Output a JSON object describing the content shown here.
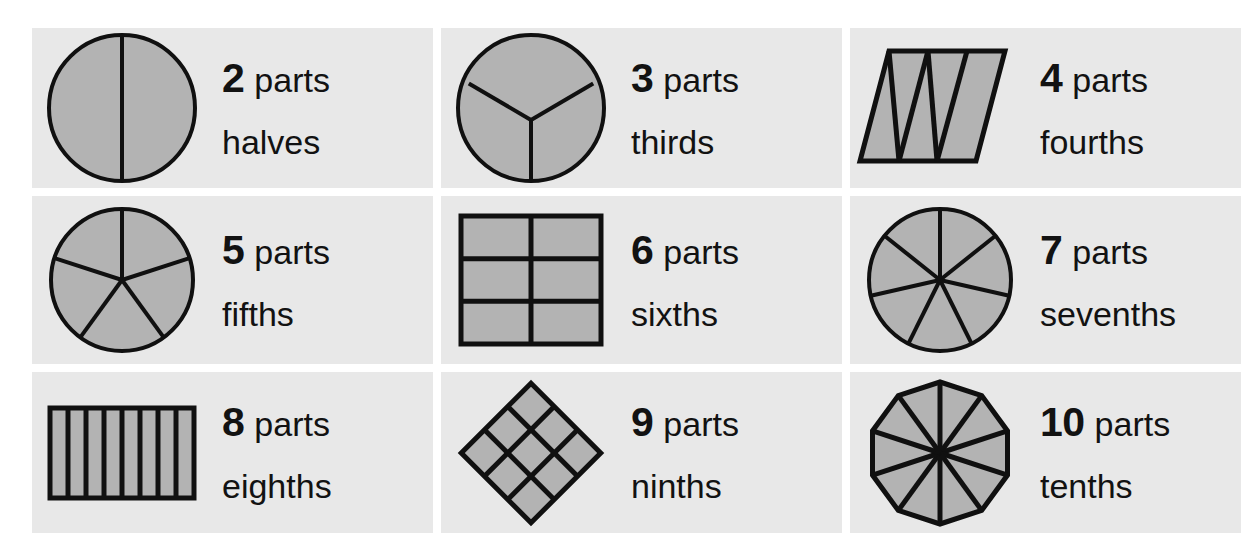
{
  "page": {
    "background_color": "#ffffff",
    "panel_color": "#e8e8e8",
    "shape_fill_color": "#b3b3b3",
    "shape_stroke_color": "#101010",
    "text_color": "#121212",
    "parts_word": "parts"
  },
  "cells": [
    {
      "count": "2",
      "parts_label": "parts",
      "fraction_name": "halves",
      "shape": "circle-halved-vertical",
      "shape_description": "circle divided by one vertical line into 2 equal parts"
    },
    {
      "count": "3",
      "parts_label": "parts",
      "fraction_name": "thirds",
      "shape": "circle-thirds-y",
      "shape_description": "circle divided by three radii in a Y pattern into 3 equal parts"
    },
    {
      "count": "4",
      "parts_label": "parts",
      "fraction_name": "fourths",
      "shape": "parallelogram-fourths-triangles",
      "shape_description": "slanted parallelogram divided by zigzag lines into 4 triangles"
    },
    {
      "count": "5",
      "parts_label": "parts",
      "fraction_name": "fifths",
      "shape": "circle-fifths",
      "shape_description": "circle divided by five radii into 5 equal wedges"
    },
    {
      "count": "6",
      "parts_label": "parts",
      "fraction_name": "sixths",
      "shape": "square-sixths-grid",
      "shape_description": "square divided into 2 columns by 3 rows making 6 rectangles"
    },
    {
      "count": "7",
      "parts_label": "parts",
      "fraction_name": "sevenths",
      "shape": "circle-sevenths",
      "shape_description": "circle divided by seven radii into 7 equal wedges"
    },
    {
      "count": "8",
      "parts_label": "parts",
      "fraction_name": "eighths",
      "shape": "rectangle-eighths-strips",
      "shape_description": "wide rectangle divided into 8 vertical strips"
    },
    {
      "count": "9",
      "parts_label": "parts",
      "fraction_name": "ninths",
      "shape": "diamond-ninths-grid",
      "shape_description": "square rotated 45 degrees divided into a 3 by 3 grid making 9 diamonds"
    },
    {
      "count": "10",
      "parts_label": "parts",
      "fraction_name": "tenths",
      "shape": "decagon-tenths",
      "shape_description": "ten sided polygon divided by ten radii into 10 equal triangles"
    }
  ]
}
